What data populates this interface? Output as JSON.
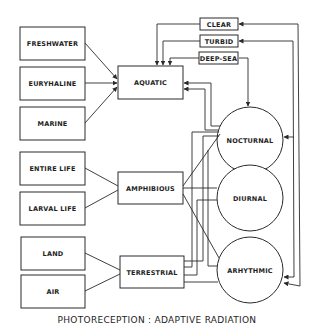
{
  "diagram": {
    "title": "PHOTORECEPTION : ADAPTIVE RADIATION",
    "left_boxes": [
      {
        "id": "freshwater",
        "label": "FRESHWATER",
        "group": "aquatic"
      },
      {
        "id": "euryhaline",
        "label": "EURYHALINE",
        "group": "aquatic"
      },
      {
        "id": "marine",
        "label": "MARINE",
        "group": "aquatic"
      },
      {
        "id": "entire-life",
        "label": "ENTIRE LIFE",
        "group": "amphibious"
      },
      {
        "id": "larval-life",
        "label": "LARVAL LIFE",
        "group": "amphibious"
      },
      {
        "id": "land",
        "label": "LAND",
        "group": "terrestrial"
      },
      {
        "id": "air",
        "label": "AIR",
        "group": "terrestrial"
      }
    ],
    "habitat_boxes": [
      {
        "id": "aquatic",
        "label": "AQUATIC"
      },
      {
        "id": "amphibious",
        "label": "AMPHIBIOUS"
      },
      {
        "id": "terrestrial",
        "label": "TERRESTRIAL"
      }
    ],
    "water_boxes": [
      {
        "id": "clear",
        "label": "CLEAR"
      },
      {
        "id": "turbid",
        "label": "TURBID"
      },
      {
        "id": "deep-sea",
        "label": "DEEP-SEA"
      }
    ],
    "activity_circles": [
      {
        "id": "nocturnal",
        "label": "NOCTURNAL"
      },
      {
        "id": "diurnal",
        "label": "DIURNAL"
      },
      {
        "id": "arhythmic",
        "label": "ARHYTHMIC"
      }
    ],
    "colors": {
      "ink": "#2a2a2a",
      "background": "#ffffff"
    }
  }
}
